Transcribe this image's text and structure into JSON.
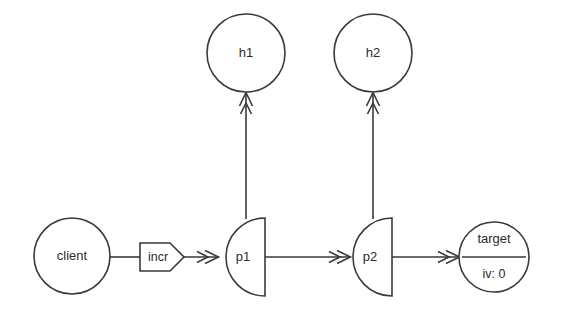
{
  "diagram": {
    "background_color": "#ffffff",
    "stroke_color": "#3a3a3a",
    "text_color": "#2b2b2b",
    "nodes": {
      "client": {
        "label": "client",
        "shape": "circle"
      },
      "p1": {
        "label": "p1",
        "shape": "half-circle"
      },
      "p2": {
        "label": "p2",
        "shape": "half-circle"
      },
      "h1": {
        "label": "h1",
        "shape": "circle"
      },
      "h2": {
        "label": "h2",
        "shape": "circle"
      },
      "target": {
        "label": "target",
        "shape": "circle-divided",
        "attribute": "iv: 0"
      }
    },
    "edges": {
      "client_to_p1": {
        "label": "incr",
        "label_shape": "pentagon"
      },
      "p1_to_p2": {
        "label": ""
      },
      "p2_to_target": {
        "label": ""
      },
      "p1_to_h1": {
        "label": ""
      },
      "p2_to_h2": {
        "label": ""
      }
    }
  }
}
